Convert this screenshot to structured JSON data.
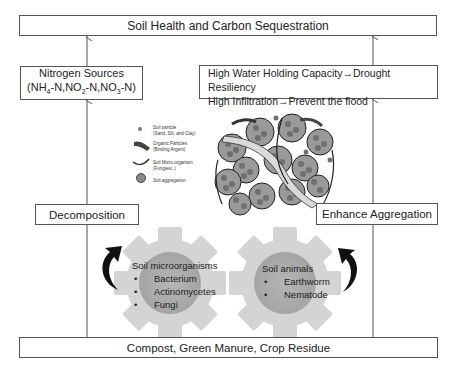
{
  "title": "Soil Health and Carbon Sequestration",
  "left_branch": {
    "output_box": {
      "line1": "Nitrogen Sources",
      "line2_parts": [
        "(NH",
        "4",
        "-N,NO",
        "2",
        "-N,NO",
        "3",
        "-N)"
      ]
    },
    "process_box": "Decomposition",
    "gear": {
      "title": "Soil microorganisms",
      "items": [
        "Bacterium",
        "Actinomycetes",
        "Fungi"
      ]
    }
  },
  "right_branch": {
    "output_box": {
      "line1": "High Water Holding Capacity→Drought Resiliency",
      "line2": "High Infiltration→Prevent the flood"
    },
    "process_box": "Enhance Aggregation",
    "gear": {
      "title": "Soil animals",
      "items": [
        "Earthworm",
        "Nematode"
      ]
    }
  },
  "legend": {
    "items": [
      {
        "icon": "soil-particle-icon",
        "label": "Soil particle",
        "sub": "(Sand, Silt, and Clay)"
      },
      {
        "icon": "organic-particle-icon",
        "label": "Organic Particles",
        "sub": "(Binding Argent)"
      },
      {
        "icon": "micro-organism-icon",
        "label": "Soil Micro-organism",
        "sub": "(Fungiest..)"
      },
      {
        "icon": "soil-aggregation-icon",
        "label": "Soil aggregation",
        "sub": ""
      }
    ]
  },
  "base": "Compost, Green Manure, Crop Residue",
  "colors": {
    "gear_outer": "#d3d3d3",
    "gear_inner": "#ababab",
    "particle": "#7a7a7a",
    "line": "#555555"
  }
}
